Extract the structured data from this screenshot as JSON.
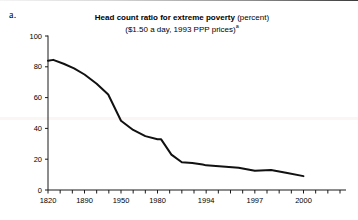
{
  "figure": {
    "panel_letter": "a.",
    "title_main": "Head count ratio for extreme poverty",
    "title_unit": "(percent)",
    "subtitle": "($1.50 a day, 1993 PPP prices)",
    "subtitle_footnote_marker": "a",
    "line_color": "#111111",
    "axis_color": "#1a1a1a",
    "background_color": "#ffffff"
  },
  "chart_data": {
    "type": "line",
    "title": "Head count ratio for extreme poverty (percent)",
    "subtitle": "($1.50 a day, 1993 PPP prices)a",
    "xlabel": "",
    "ylabel": "",
    "ylim": [
      0,
      100
    ],
    "yticks": [
      0,
      20,
      40,
      60,
      80,
      100
    ],
    "ytick_labels": [
      "0",
      "20",
      "40",
      "60",
      "80",
      "100"
    ],
    "xlim": [
      1820,
      2000
    ],
    "xtick_labels": [
      "1820",
      "1890",
      "1950",
      "1980",
      "1994",
      "1997",
      "2000"
    ],
    "xtick_label_positions": [
      1820,
      1890,
      1950,
      1980,
      1994,
      1997,
      2000
    ],
    "minor_tick_count": 25,
    "grid": false,
    "legend": false,
    "series": [
      {
        "name": "Head count ratio for extreme poverty",
        "x": [
          1820,
          1830,
          1850,
          1870,
          1890,
          1910,
          1929,
          1950,
          1960,
          1970,
          1980,
          1981,
          1984,
          1987,
          1990,
          1993,
          1994,
          1996,
          1997,
          1998,
          1999,
          2000
        ],
        "values": [
          84,
          84.5,
          82,
          79,
          75,
          69,
          62,
          45,
          39,
          35,
          33,
          33,
          23,
          18,
          17.5,
          16.5,
          16,
          14.5,
          12.5,
          13,
          11,
          9
        ]
      }
    ]
  }
}
